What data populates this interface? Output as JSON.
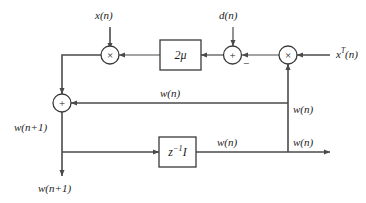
{
  "diagram": {
    "colors": {
      "background": "#ffffff",
      "line": "#4a4a4a",
      "stroke_dark": "#3a3a3a",
      "text": "#1c1c1c"
    },
    "inputs": [
      {
        "id": "x-input",
        "label": "x(n)",
        "role": "reference input signal"
      },
      {
        "id": "d-input",
        "label": "d(n)",
        "role": "desired response"
      },
      {
        "id": "xt-input",
        "label": "xT(n)",
        "base": "x",
        "superscript": "T",
        "suffix": "(n)",
        "role": "transposed input vector"
      }
    ],
    "nodes": [
      {
        "id": "multiplier-left",
        "glyph": "×",
        "kind": "multiplier"
      },
      {
        "id": "adder-error",
        "glyph": "+",
        "kind": "summing-junction",
        "secondary_sign": "−"
      },
      {
        "id": "multiplier-right",
        "glyph": "×",
        "kind": "multiplier"
      },
      {
        "id": "adder-weight",
        "glyph": "+",
        "kind": "summing-junction"
      }
    ],
    "blocks": [
      {
        "id": "gain-block",
        "label": "2μ",
        "role": "step-size gain"
      },
      {
        "id": "delay-block",
        "base": "z",
        "superscript": "−1",
        "suffix": "I",
        "label": "z−1I",
        "role": "unit delay"
      }
    ],
    "signal_labels": [
      {
        "id": "w-next-left",
        "text": "w(n+1)"
      },
      {
        "id": "w-next-bottom",
        "text": "w(n+1)"
      },
      {
        "id": "w-feedback-top",
        "text": "w(n)"
      },
      {
        "id": "w-feedback-right-upper",
        "text": "w(n)"
      },
      {
        "id": "w-delay-out",
        "text": "w(n)"
      },
      {
        "id": "w-output-right",
        "text": "w(n)"
      }
    ]
  }
}
